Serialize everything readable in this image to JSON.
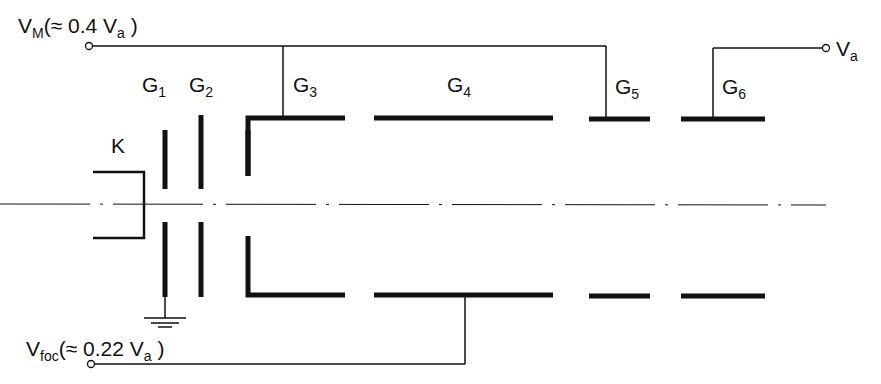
{
  "diagram": {
    "labels": {
      "vm": {
        "main": "V",
        "sub": "M",
        "paren_open": "(≈ 0.4 V",
        "paren_sub": "a",
        "paren_close": " )"
      },
      "va": {
        "main": "V",
        "sub": "a"
      },
      "vfoc": {
        "main": "V",
        "sub": "foc",
        "paren_open": "(≈ 0.22 V",
        "paren_sub": "a",
        "paren_close": " )"
      },
      "k": "K",
      "g1": {
        "main": "G",
        "sub": "1"
      },
      "g2": {
        "main": "G",
        "sub": "2"
      },
      "g3": {
        "main": "G",
        "sub": "3"
      },
      "g4": {
        "main": "G",
        "sub": "4"
      },
      "g5": {
        "main": "G",
        "sub": "5"
      },
      "g6": {
        "main": "G",
        "sub": "6"
      }
    },
    "nodes": [
      "K",
      "G1",
      "G2",
      "G3",
      "G4",
      "G5",
      "G6",
      "VM",
      "Va",
      "Vfoc",
      "ground"
    ],
    "connections": [
      {
        "from": "VM",
        "to": [
          "G3",
          "G5"
        ]
      },
      {
        "from": "Va",
        "to": [
          "G6"
        ]
      },
      {
        "from": "Vfoc",
        "to": [
          "G4"
        ]
      },
      {
        "from": "G1",
        "to": [
          "ground"
        ]
      }
    ],
    "colors": {
      "stroke": "#111111",
      "background": "#ffffff"
    }
  }
}
